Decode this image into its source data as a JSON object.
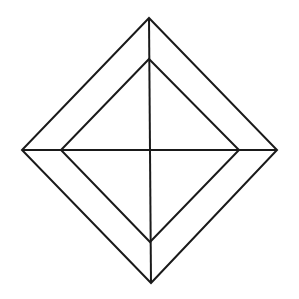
{
  "diagram": {
    "title": "",
    "canvas": {
      "width": 299,
      "height": 299,
      "background": "#ffffff"
    },
    "stroke": {
      "color": "#1a1a1a",
      "width": 2
    },
    "outer_diamond": {
      "top": [
        149,
        18
      ],
      "right": [
        277,
        150
      ],
      "bottom": [
        151,
        283
      ],
      "left": [
        22,
        150
      ]
    },
    "inner_diamond": {
      "top": [
        149,
        59
      ],
      "right": [
        239,
        150
      ],
      "bottom": [
        150,
        242
      ],
      "left": [
        61,
        150
      ]
    },
    "vertical_axis": {
      "from": [
        149,
        18
      ],
      "to": [
        151,
        283
      ]
    },
    "horizontal_axis": {
      "from": [
        22,
        150
      ],
      "to": [
        277,
        150
      ]
    },
    "center": [
      150,
      150
    ]
  }
}
